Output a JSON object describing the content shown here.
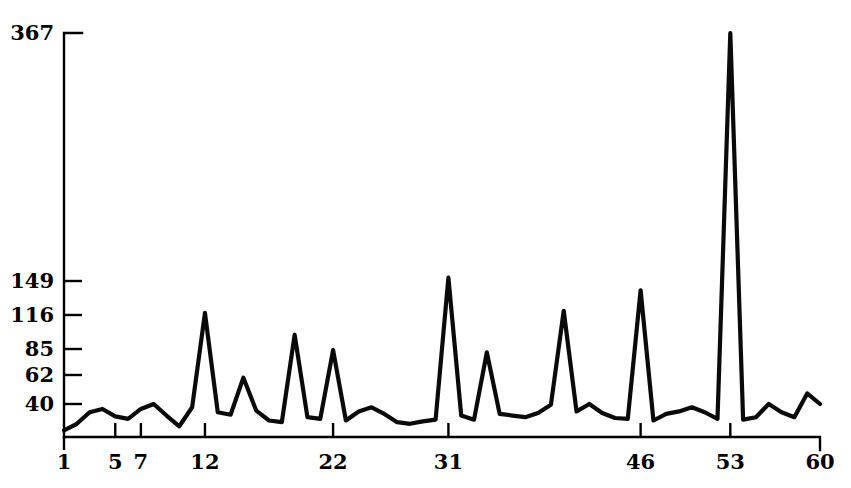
{
  "chart_data": {
    "type": "line",
    "title": "",
    "subtitle": "",
    "xlabel": "",
    "ylabel": "",
    "grid": false,
    "legend": "none",
    "y_scale": "nonlinear-sqrt",
    "ylim": [
      0,
      367
    ],
    "xlim": [
      1,
      60
    ],
    "y_tick_labels": [
      "367",
      "149",
      "116",
      "85",
      "62",
      "40"
    ],
    "y_ticks": [
      367,
      149,
      116,
      85,
      62,
      40
    ],
    "x_tick_labels": [
      "1",
      "5",
      "7",
      "12",
      "22",
      "31",
      "46",
      "53",
      "60"
    ],
    "x_ticks": [
      1,
      5,
      7,
      12,
      22,
      31,
      46,
      53,
      60
    ],
    "x": [
      1,
      2,
      3,
      4,
      5,
      6,
      7,
      8,
      9,
      10,
      11,
      12,
      13,
      14,
      15,
      16,
      17,
      18,
      19,
      20,
      21,
      22,
      23,
      24,
      25,
      26,
      27,
      28,
      29,
      30,
      31,
      32,
      33,
      34,
      35,
      36,
      37,
      38,
      39,
      40,
      41,
      42,
      43,
      44,
      45,
      46,
      47,
      48,
      49,
      50,
      51,
      52,
      53,
      54,
      55,
      56,
      57,
      58,
      59,
      60
    ],
    "values": [
      8,
      16,
      30,
      34,
      25,
      22,
      34,
      40,
      26,
      13,
      36,
      118,
      30,
      27,
      60,
      32,
      20,
      18,
      98,
      24,
      22,
      84,
      20,
      31,
      36,
      28,
      18,
      16,
      19,
      21,
      152,
      26,
      21,
      82,
      28,
      26,
      24,
      29,
      39,
      120,
      31,
      40,
      29,
      23,
      22,
      140,
      20,
      28,
      31,
      36,
      30,
      22,
      367,
      21,
      24,
      40,
      30,
      24,
      48,
      40
    ],
    "series": [
      {
        "name": "series-1",
        "values": [
          8,
          16,
          30,
          34,
          25,
          22,
          34,
          40,
          26,
          13,
          36,
          118,
          30,
          27,
          60,
          32,
          20,
          18,
          98,
          24,
          22,
          84,
          20,
          31,
          36,
          28,
          18,
          16,
          19,
          21,
          152,
          26,
          21,
          82,
          28,
          26,
          24,
          29,
          39,
          120,
          31,
          40,
          29,
          23,
          22,
          140,
          20,
          28,
          31,
          36,
          30,
          22,
          367,
          21,
          24,
          40,
          30,
          24,
          48,
          40
        ]
      }
    ],
    "annotations": []
  },
  "geometry": {
    "plot_left": 64,
    "plot_right": 820,
    "plot_top": 33,
    "plot_bottom": 437,
    "y_tick_pixels": [
      33,
      281,
      315,
      349,
      375,
      404
    ]
  }
}
